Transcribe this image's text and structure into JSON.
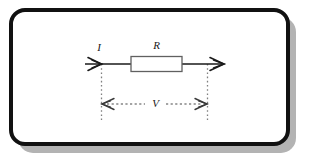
{
  "figure": {
    "frame": {
      "border_color": "#111111",
      "fill_color": "#ffffff",
      "shadow_color": "#b0b0b0",
      "corner_radius": 14,
      "border_width": 4
    },
    "colors": {
      "wire": "#1a1a1a",
      "component_outline": "#555555",
      "component_fill": "#ffffff",
      "dimension": "#444444",
      "extension_line": "#777777",
      "label_text": "#1a1a1a"
    },
    "labels": {
      "current": "I",
      "resistance": "R",
      "voltage": "V"
    },
    "elements": [
      {
        "name": "current-arrow",
        "label": "I",
        "kind": "arrowhead"
      },
      {
        "name": "resistor-body",
        "label": "R",
        "kind": "rectangle"
      },
      {
        "name": "output-arrow",
        "label": "",
        "kind": "arrowhead"
      },
      {
        "name": "voltage-dimension",
        "label": "V",
        "kind": "double-arrow-dashed"
      },
      {
        "name": "extension-line-left",
        "label": "",
        "kind": "dotted-vertical"
      },
      {
        "name": "extension-line-right",
        "label": "",
        "kind": "dotted-vertical"
      }
    ]
  }
}
